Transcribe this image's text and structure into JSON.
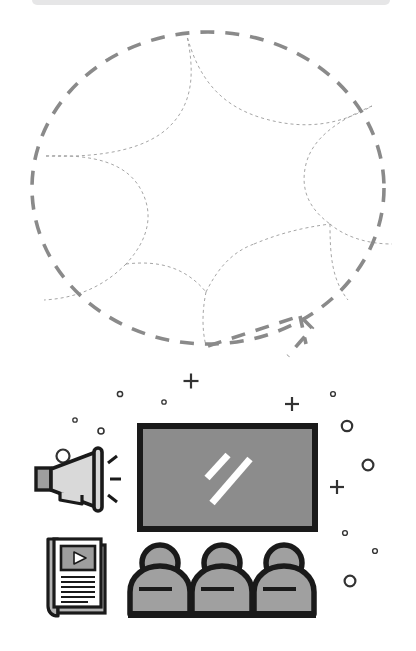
{
  "page": {
    "background_color": "#ffffff",
    "width": 416,
    "height": 651,
    "top_bar_color": "#e6e6e7"
  },
  "diagram": {
    "name": "segmented-dashed-circle",
    "outline_color": "#8a8a8a",
    "divider_color": "#9b9b9b",
    "outline_dash": "14 11",
    "outline_width": 3.6,
    "divider_dash": "3 3",
    "divider_width": 0.9,
    "segment_count": 6,
    "center": {
      "x": 208,
      "y": 176
    },
    "radius_x": 176,
    "radius_y": 156,
    "has_notch": true,
    "notch_label": "bottom-right-arrow-notch"
  },
  "illustration": {
    "name": "media-presentation-scene",
    "colors": {
      "outline": "#1a1a1a",
      "screen_fill": "#8c8c8c",
      "figure_fill": "#a0a0a0",
      "megaphone_fill": "#d9d9d9",
      "megaphone_handle_fill": "#9e9e9e",
      "paper_fill": "#ffffff",
      "paper_spine_fill": "#b4b4b4",
      "thumbnail_fill": "#9e9e9e",
      "accent_white": "#ffffff",
      "decor_color": "#333333"
    },
    "items": [
      {
        "name": "megaphone",
        "label": "Megaphone"
      },
      {
        "name": "screen",
        "label": "Presentation screen"
      },
      {
        "name": "magazine",
        "label": "Magazine with video"
      },
      {
        "name": "audience",
        "label": "Audience of three"
      }
    ],
    "audience_count": 3,
    "screen_slash_count": 2,
    "megaphone_ray_count": 3,
    "magazine_text_line_count": 6,
    "decor": {
      "circles": [
        {
          "cx": 63,
          "cy": 456,
          "r": 6.5,
          "w": 2.2
        },
        {
          "cx": 101,
          "cy": 431,
          "r": 3.0,
          "w": 1.6
        },
        {
          "cx": 75,
          "cy": 420,
          "r": 2.2,
          "w": 1.3
        },
        {
          "cx": 120,
          "cy": 394,
          "r": 2.6,
          "w": 1.5
        },
        {
          "cx": 164,
          "cy": 402,
          "r": 2.2,
          "w": 1.3
        },
        {
          "cx": 333,
          "cy": 394,
          "r": 2.4,
          "w": 1.4
        },
        {
          "cx": 347,
          "cy": 426,
          "r": 5.2,
          "w": 2.2
        },
        {
          "cx": 368,
          "cy": 465,
          "r": 5.4,
          "w": 2.2
        },
        {
          "cx": 345,
          "cy": 533,
          "r": 2.4,
          "w": 1.4
        },
        {
          "cx": 375,
          "cy": 551,
          "r": 2.4,
          "w": 1.4
        },
        {
          "cx": 350,
          "cy": 581,
          "r": 5.4,
          "w": 2.2
        }
      ],
      "pluses": [
        {
          "cx": 191,
          "cy": 381,
          "s": 7.5,
          "w": 2.2
        },
        {
          "cx": 292,
          "cy": 404,
          "s": 7.0,
          "w": 2.2
        },
        {
          "cx": 337,
          "cy": 487,
          "s": 7.0,
          "w": 2.2
        }
      ]
    }
  }
}
